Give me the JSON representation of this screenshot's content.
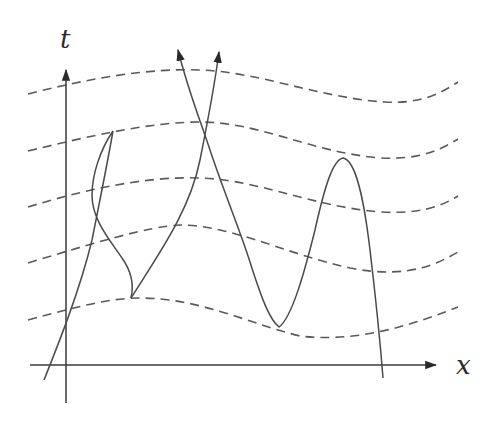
{
  "figure": {
    "type": "spacetime-diagram",
    "axes": {
      "vertical_label": "t",
      "horizontal_label": "x"
    },
    "colors": {
      "line": "#4a4a4a",
      "dashed": "#5a5a5a",
      "background": "#ffffff"
    },
    "dashed_surfaces_count": 5,
    "worldlines": [
      {
        "name": "zigzag-worldline-left",
        "description": "worldline bending back in time with a sharp corner at top and bottom"
      },
      {
        "name": "crossing-worldline-arrow-right",
        "description": "worldline rising to upper arrow"
      },
      {
        "name": "crossing-worldline-arrow-left",
        "description": "worldline descending from upper arrow into oscillating curve"
      },
      {
        "name": "oscillating-worldline",
        "description": "curve with minimum near lowest surface and peak near second surface"
      }
    ]
  }
}
